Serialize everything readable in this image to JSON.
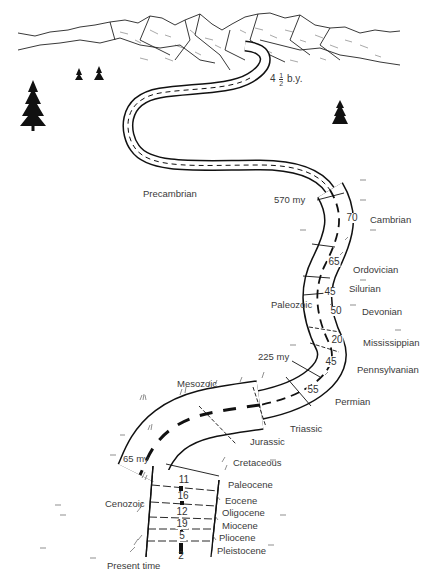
{
  "diagram": {
    "start_label": {
      "whole": "4",
      "frac_num": "1",
      "frac_den": "2",
      "unit": "b.y."
    },
    "end_label": "Present time",
    "markers": {
      "m570": "570 my",
      "m225": "225 my",
      "m65": "65 my"
    },
    "eras": {
      "precambrian": "Precambrian",
      "paleozoic": "Paleozoic",
      "mesozoic": "Mesozoic",
      "cenozoic": "Cenozoic"
    },
    "periods": [
      {
        "name": "Cambrian",
        "duration": "70",
        "era": "Paleozoic"
      },
      {
        "name": "Ordovician",
        "duration": "65",
        "era": "Paleozoic"
      },
      {
        "name": "Silurian",
        "duration": "45",
        "era": "Paleozoic"
      },
      {
        "name": "Devonian",
        "duration": "50",
        "era": "Paleozoic"
      },
      {
        "name": "Mississippian",
        "duration": "20",
        "era": "Paleozoic"
      },
      {
        "name": "Pennsylvanian",
        "duration": "45",
        "era": "Paleozoic"
      },
      {
        "name": "Permian",
        "duration": "55",
        "era": "Paleozoic"
      },
      {
        "name": "Triassic",
        "duration": "",
        "era": "Mesozoic"
      },
      {
        "name": "Jurassic",
        "duration": "",
        "era": "Mesozoic"
      },
      {
        "name": "Cretaceous",
        "duration": "",
        "era": "Mesozoic"
      }
    ],
    "epochs": [
      {
        "name": "Paleocene",
        "duration": "11"
      },
      {
        "name": "Eocene",
        "duration": "16"
      },
      {
        "name": "Oligocene",
        "duration": "12"
      },
      {
        "name": "Miocene",
        "duration": "19"
      },
      {
        "name": "Pliocene",
        "duration": "5"
      },
      {
        "name": "Pleistocene",
        "duration": "2"
      }
    ],
    "colors": {
      "ink": "#111111",
      "label": "#3a3a3a",
      "paper": "#ffffff"
    }
  }
}
